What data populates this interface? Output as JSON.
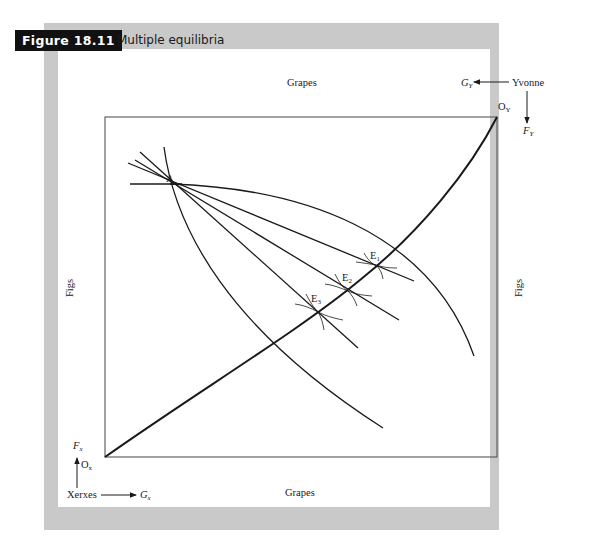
{
  "figure": {
    "number_label": "Figure 18.11",
    "title": "Multiple equilibria"
  },
  "edgeworth_box": {
    "top_axis_label": "Grapes",
    "bottom_axis_label": "Grapes",
    "left_axis_label": "Figs",
    "right_axis_label": "Figs",
    "origin_x": {
      "label": "O",
      "subscript": "x"
    },
    "origin_y": {
      "label": "O",
      "subscript": "Y"
    },
    "endowment_point": "A",
    "equilibria": [
      {
        "label": "E",
        "subscript": "1"
      },
      {
        "label": "E",
        "subscript": "2"
      },
      {
        "label": "E",
        "subscript": "3"
      }
    ]
  },
  "agents": {
    "xerxes": {
      "name": "Xerxes",
      "vertical_axis": {
        "label": "F",
        "subscript": "x"
      },
      "horizontal_axis": {
        "label": "G",
        "subscript": "x"
      }
    },
    "yvonne": {
      "name": "Yvonne",
      "vertical_axis": {
        "label": "F",
        "subscript": "Y"
      },
      "horizontal_axis": {
        "label": "G",
        "subscript": "Y"
      }
    }
  },
  "colors": {
    "frame_gray": "#c9c9c9",
    "badge_black": "#111111",
    "line": "#1a1a1a"
  }
}
